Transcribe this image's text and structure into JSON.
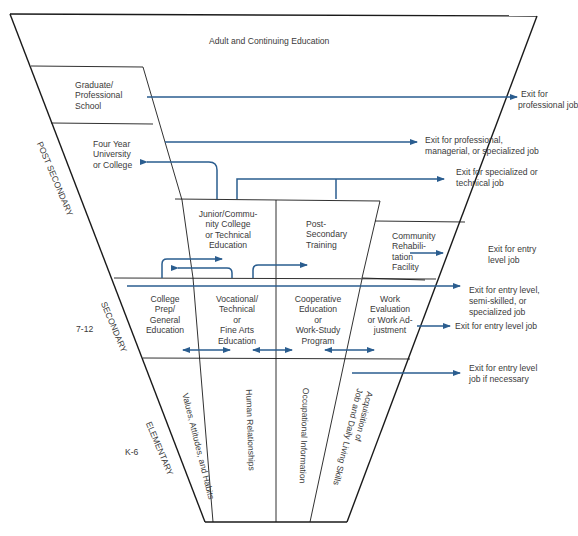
{
  "diagram": {
    "type": "career-education-funnel",
    "colors": {
      "line": "#1a1a1a",
      "arrow": "#2a5d8f",
      "text": "#3a3a3a",
      "background": "#ffffff"
    },
    "top_label": "Adult and Continuing Education",
    "levels": {
      "post_secondary": "POST SECONDARY",
      "secondary": "SECONDARY",
      "secondary_grades": "7-12",
      "elementary": "ELEMENTARY",
      "elementary_grades": "K-6"
    },
    "boxes": {
      "graduate": [
        "Graduate/",
        "Professional",
        "School"
      ],
      "university": [
        "Four Year",
        "University",
        "or College"
      ],
      "junior_college": [
        "Junior/Commu-",
        "nity College",
        "or Technical",
        "Education"
      ],
      "post_secondary_training": [
        "Post-",
        "Secondary",
        "Training"
      ],
      "community_rehab": [
        "Community",
        "Rehabili-",
        "tation",
        "Facility"
      ],
      "college_prep": [
        "College",
        "Prep/",
        "General",
        "Education"
      ],
      "vocational": [
        "Vocational/",
        "Technical",
        "or",
        "Fine Arts",
        "Education"
      ],
      "cooperative": [
        "Cooperative",
        "Education",
        "or",
        "Work-Study",
        "Program"
      ],
      "work_evaluation": [
        "Work",
        "Evaluation",
        "or Work Ad-",
        "justment"
      ]
    },
    "elementary_columns": {
      "values": "Values, Attitudes, and Habits",
      "human": "Human Relationships",
      "occupational": "Occupational Information",
      "acquisition_1": "Acquisition of",
      "acquisition_2": "Job and Daily Living Skills"
    },
    "exits": {
      "professional": [
        "Exit for",
        "professional job"
      ],
      "managerial": [
        "Exit for professional,",
        "managerial, or specialized job"
      ],
      "technical": [
        "Exit for specialized or",
        "technical job"
      ],
      "rehab_entry": [
        "Exit for entry",
        "level job"
      ],
      "semi_skilled": [
        "Exit for entry level,",
        "semi-skilled, or",
        "specialized job"
      ],
      "work_eval_entry": [
        "Exit for entry level job"
      ],
      "if_necessary": [
        "Exit for entry level",
        "job if necessary"
      ]
    }
  }
}
